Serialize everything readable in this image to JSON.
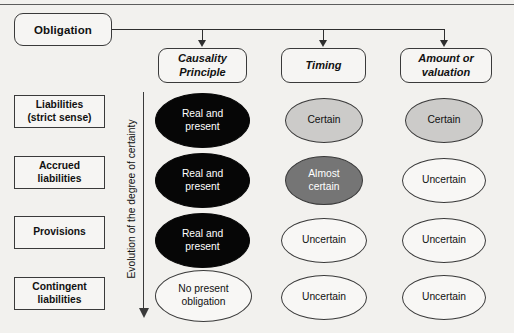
{
  "diagram": {
    "title": "Obligation",
    "axis_caption": "Evolution of the degree of certainty",
    "colors": {
      "background": "#f2f1ee",
      "stroke": "#3a3a3a",
      "fill_black": "#060606",
      "fill_dark_gray": "#757575",
      "fill_light_gray": "#cccbc9",
      "fill_white": "#f8f7f5"
    },
    "columns": [
      {
        "label": "Causality\nPrinciple",
        "line1": "Causality",
        "line2": "Principle"
      },
      {
        "label": "Timing",
        "line1": "Timing",
        "line2": ""
      },
      {
        "label": "Amount or\nvaluation",
        "line1": "Amount or",
        "line2": "valuation"
      }
    ],
    "rows": [
      {
        "line1": "Liabilities",
        "line2": "(strict sense)"
      },
      {
        "line1": "Accrued",
        "line2": "liabilities"
      },
      {
        "line1": "Provisions",
        "line2": ""
      },
      {
        "line1": "Contingent",
        "line2": "liabilities"
      }
    ],
    "cells": [
      [
        {
          "line1": "Real and",
          "line2": "present",
          "fill": "black"
        },
        {
          "line1": "Certain",
          "line2": "",
          "fill": "light"
        },
        {
          "line1": "Certain",
          "line2": "",
          "fill": "light"
        }
      ],
      [
        {
          "line1": "Real and",
          "line2": "present",
          "fill": "black"
        },
        {
          "line1": "Almost",
          "line2": "certain",
          "fill": "dark"
        },
        {
          "line1": "Uncertain",
          "line2": "",
          "fill": "white"
        }
      ],
      [
        {
          "line1": "Real and",
          "line2": "present",
          "fill": "black"
        },
        {
          "line1": "Uncertain",
          "line2": "",
          "fill": "white"
        },
        {
          "line1": "Uncertain",
          "line2": "",
          "fill": "white"
        }
      ],
      [
        {
          "line1": "No present",
          "line2": "obligation",
          "fill": "white"
        },
        {
          "line1": "Uncertain",
          "line2": "",
          "fill": "white"
        },
        {
          "line1": "Uncertain",
          "line2": "",
          "fill": "white"
        }
      ]
    ]
  }
}
